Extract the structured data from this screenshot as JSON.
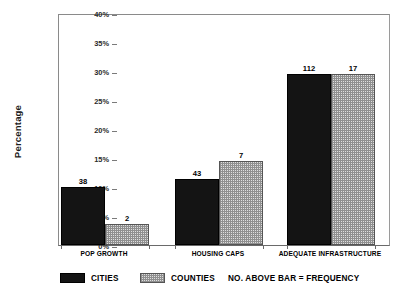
{
  "chart_data": {
    "type": "bar",
    "title": "",
    "xlabel": "",
    "ylabel": "Percentage",
    "categories": [
      "POP GROWTH",
      "HOUSING CAPS",
      "ADEQUATE INFRASTRUCTURE"
    ],
    "ylim": [
      0,
      40
    ],
    "ytick_labels": [
      "0%",
      "5%",
      "10%",
      "15%",
      "20%",
      "25%",
      "30%",
      "35%",
      "40%"
    ],
    "ytick_values": [
      0,
      5,
      10,
      15,
      20,
      25,
      30,
      35,
      40
    ],
    "grid": false,
    "legend_position": "bottom",
    "series": [
      {
        "name": "CITIES",
        "color": "#141414",
        "values": [
          10.0,
          11.3,
          29.5
        ],
        "frequencies": [
          38,
          43,
          112
        ],
        "point_labels": [
          "38",
          "43",
          "112"
        ]
      },
      {
        "name": "COUNTIES",
        "color": "#dedede",
        "values": [
          3.6,
          14.4,
          29.5
        ],
        "frequencies": [
          2,
          7,
          17
        ],
        "point_labels": [
          "2",
          "7",
          "17"
        ]
      }
    ],
    "annotations": [
      "NO. ABOVE BAR = FREQUENCY"
    ]
  },
  "axis": {
    "y_title": "Percentage",
    "y_ticks": [
      {
        "label": "40%",
        "value": 40
      },
      {
        "label": "35%",
        "value": 35
      },
      {
        "label": "30%",
        "value": 30
      },
      {
        "label": "25%",
        "value": 25
      },
      {
        "label": "20%",
        "value": 20
      },
      {
        "label": "15%",
        "value": 15
      },
      {
        "label": "10%",
        "value": 10
      },
      {
        "label": "5%",
        "value": 5
      },
      {
        "label": "0%",
        "value": 0
      }
    ],
    "x_categories": [
      "POP GROWTH",
      "HOUSING CAPS",
      "ADEQUATE INFRASTRUCTURE"
    ]
  },
  "bars": [
    {
      "group": "POP GROWTH",
      "series": "CITIES",
      "value": 10.0,
      "label": "38"
    },
    {
      "group": "POP GROWTH",
      "series": "COUNTIES",
      "value": 3.6,
      "label": "2"
    },
    {
      "group": "HOUSING CAPS",
      "series": "CITIES",
      "value": 11.3,
      "label": "43"
    },
    {
      "group": "HOUSING CAPS",
      "series": "COUNTIES",
      "value": 14.4,
      "label": "7"
    },
    {
      "group": "ADEQUATE INFRASTRUCTURE",
      "series": "CITIES",
      "value": 29.5,
      "label": "112"
    },
    {
      "group": "ADEQUATE INFRASTRUCTURE",
      "series": "COUNTIES",
      "value": 29.5,
      "label": "17"
    }
  ],
  "legend": {
    "items": [
      {
        "label": "CITIES",
        "swatch": "solid-black-swatch"
      },
      {
        "label": "COUNTIES",
        "swatch": "dotted-grey-swatch"
      }
    ],
    "note": "NO. ABOVE BAR = FREQUENCY"
  }
}
